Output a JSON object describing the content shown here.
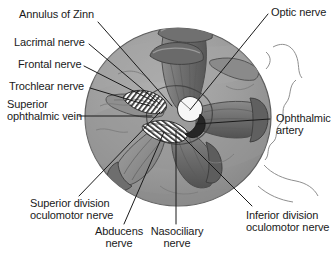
{
  "figure": {
    "kind": "anatomical-illustration",
    "style": "grayscale line drawing",
    "colors": {
      "background": "#ffffff",
      "disc_fill": "#9d9d9d",
      "disc_edge": "#6f6f6f",
      "muscle_mid": "#7b7b7b",
      "muscle_dark": "#5a5a5a",
      "shadow": "#4a4a4a",
      "highlight": "#c9c9c9",
      "optic_nerve_fill": "#f7f7f7",
      "ophthalmic_artery_fill": "#262626",
      "label_text": "#1a1a1a",
      "leader_line": "#1a1a1a"
    }
  },
  "labels": [
    {
      "id": "annulus-of-zinn",
      "lines": [
        "Annulus of Zinn"
      ],
      "align": "left"
    },
    {
      "id": "lacrimal-nerve",
      "lines": [
        "Lacrimal nerve"
      ],
      "align": "left"
    },
    {
      "id": "frontal-nerve",
      "lines": [
        "Frontal nerve"
      ],
      "align": "left"
    },
    {
      "id": "trochlear-nerve",
      "lines": [
        "Trochlear nerve"
      ],
      "align": "left"
    },
    {
      "id": "superior-ophthalmic-vein",
      "lines": [
        "Superior",
        "ophthalmic vein"
      ],
      "align": "left"
    },
    {
      "id": "optic-nerve",
      "lines": [
        "Optic nerve"
      ],
      "align": "left"
    },
    {
      "id": "ophthalmic-artery",
      "lines": [
        "Ophthalmic",
        "artery"
      ],
      "align": "left"
    },
    {
      "id": "inferior-division-oculomotor-nerve",
      "lines": [
        "Inferior division",
        "oculomotor nerve"
      ],
      "align": "left"
    },
    {
      "id": "superior-division-oculomotor-nerve",
      "lines": [
        "Superior division",
        "oculomotor nerve"
      ],
      "align": "left"
    },
    {
      "id": "abducens-nerve",
      "lines": [
        "Abducens",
        "nerve"
      ],
      "align": "center"
    },
    {
      "id": "nasociliary-nerve",
      "lines": [
        "Nasociliary",
        "nerve"
      ],
      "align": "center"
    }
  ],
  "text": {
    "annulus_of_zinn": "Annulus of Zinn",
    "lacrimal_nerve": "Lacrimal nerve",
    "frontal_nerve": "Frontal nerve",
    "trochlear_nerve": "Trochlear nerve",
    "superior_ophthalmic_vein_l1": "Superior",
    "superior_ophthalmic_vein_l2": "ophthalmic vein",
    "optic_nerve": "Optic nerve",
    "ophthalmic_artery_l1": "Ophthalmic",
    "ophthalmic_artery_l2": "artery",
    "inferior_division_l1": "Inferior division",
    "inferior_division_l2": "oculomotor nerve",
    "superior_division_l1": "Superior division",
    "superior_division_l2": "oculomotor nerve",
    "abducens_l1": "Abducens",
    "abducens_l2": "nerve",
    "nasociliary_l1": "Nasociliary",
    "nasociliary_l2": "nerve"
  }
}
